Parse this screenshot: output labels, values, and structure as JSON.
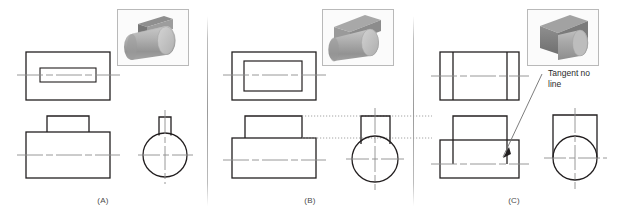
{
  "figure": {
    "background_color": "#ffffff",
    "line_color": "#231f20",
    "centerline_color": "#8c8c8c",
    "projection_line_color": "#9a9a9a",
    "divider_color": "#9a9a9a",
    "width": 620,
    "height": 222
  },
  "panels": [
    {
      "id": "A",
      "label": "(A)",
      "thumbnail": {
        "name": "pictorial-cylinder-with-thin-rib",
        "description": "Gray shaded cylinder lying horizontally with a thin vertical rectangular rib on top",
        "body_color": "#a9a9a9",
        "top_color": "#8a8a8a",
        "end_color": "#c3c3c3",
        "frame_color": "#b9b9b9"
      },
      "views": [
        {
          "name": "top-view",
          "description": "Outer rectangle with narrow inner rectangle representing thin rib, horizontal centerline through middle"
        },
        {
          "name": "front-view",
          "description": "Large rectangle with small rectangular boss centered on top edge, horizontal centerline"
        },
        {
          "name": "right-side-view",
          "description": "Circle with narrow rectangle tangent on top, vertical and horizontal centerlines"
        }
      ]
    },
    {
      "id": "B",
      "label": "(B)",
      "thumbnail": {
        "name": "pictorial-cylinder-with-wide-block",
        "description": "Gray shaded cylinder lying horizontally with a wide rectangular block on top",
        "body_color": "#a9a9a9",
        "top_color": "#8f8f8f",
        "end_color": "#c3c3c3",
        "frame_color": "#b9b9b9"
      },
      "views": [
        {
          "name": "top-view",
          "description": "Outer rectangle with large inner rectangle, horizontal centerline through middle"
        },
        {
          "name": "front-view",
          "description": "Large rectangle with wide rectangular boss on top, horizontal centerline"
        },
        {
          "name": "right-side-view",
          "description": "Circle with rectangle on top whose sides are narrower than circle diameter, vertical and horizontal centerlines"
        }
      ],
      "projection_lines": {
        "name": "alignment-projection-lines",
        "style": "dotted",
        "count": 2,
        "description": "Two horizontal dotted lines aligning the front view boss with the side view"
      }
    },
    {
      "id": "C",
      "label": "(C)",
      "thumbnail": {
        "name": "pictorial-block-tangent-cylinder",
        "description": "Dark gray rectangular block with cylinder tangent at its base",
        "body_color": "#8e8e8e",
        "top_color": "#6f6f6f",
        "end_color": "#b5b5b5",
        "frame_color": "#b9b9b9"
      },
      "views": [
        {
          "name": "top-view",
          "description": "Rectangle with two internal vertical lines, horizontal centerline"
        },
        {
          "name": "front-view",
          "description": "Rectangle with wide boss on top and internal vertical lines, horizontal centerline, leader arrow pointing to tangent location"
        },
        {
          "name": "right-side-view",
          "description": "Square with inscribed circle tangent to left and right sides, vertical and horizontal centerlines"
        }
      ],
      "annotation": {
        "name": "tangent-no-line-note",
        "line1": "Tangent no",
        "line2": "line",
        "leader": "line with arrowhead pointing down-left to tangent point in front view"
      }
    }
  ]
}
